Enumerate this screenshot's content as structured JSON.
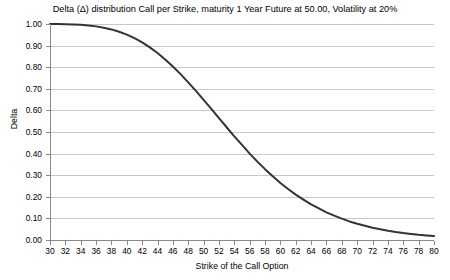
{
  "chart_data": {
    "type": "line",
    "title": "Delta (Δ) distribution Call per Strike, maturity 1 Year Future at 50.00, Volatility at 20%",
    "xlabel": "Strike of the Call Option",
    "ylabel": "Delta",
    "xlim": [
      30,
      80
    ],
    "ylim": [
      0.0,
      1.0
    ],
    "grid": true,
    "legend": null,
    "xticks": [
      30,
      32,
      34,
      36,
      38,
      40,
      42,
      44,
      46,
      48,
      50,
      52,
      54,
      56,
      58,
      60,
      62,
      64,
      66,
      68,
      70,
      72,
      74,
      76,
      78,
      80
    ],
    "xtick_labels": [
      "30",
      "32",
      "34",
      "36",
      "38",
      "40",
      "42",
      "44",
      "46",
      "48",
      "50",
      "52",
      "54",
      "56",
      "58",
      "60",
      "62",
      "64",
      "66",
      "68",
      "70",
      "72",
      "74",
      "76",
      "78",
      "80"
    ],
    "yticks": [
      0.0,
      0.1,
      0.2,
      0.3,
      0.4,
      0.5,
      0.6,
      0.7,
      0.8,
      0.9,
      1.0
    ],
    "ytick_labels": [
      "0.00",
      "0.10",
      "0.20",
      "0.30",
      "0.40",
      "0.50",
      "0.60",
      "0.70",
      "0.80",
      "0.90",
      "1.00"
    ],
    "series": [
      {
        "name": "Delta",
        "color": "#333333",
        "width": 2,
        "x": [
          30,
          31,
          32,
          33,
          34,
          35,
          36,
          37,
          38,
          39,
          40,
          41,
          42,
          43,
          44,
          45,
          46,
          47,
          48,
          49,
          50,
          51,
          52,
          53,
          54,
          55,
          56,
          57,
          58,
          59,
          60,
          61,
          62,
          63,
          64,
          65,
          66,
          67,
          68,
          69,
          70,
          71,
          72,
          73,
          74,
          75,
          76,
          77,
          78,
          79,
          80
        ],
        "values": [
          1.0,
          1.0,
          0.999,
          0.998,
          0.996,
          0.993,
          0.989,
          0.983,
          0.975,
          0.964,
          0.951,
          0.935,
          0.915,
          0.892,
          0.866,
          0.836,
          0.803,
          0.768,
          0.73,
          0.69,
          0.649,
          0.607,
          0.564,
          0.522,
          0.48,
          0.44,
          0.4,
          0.363,
          0.328,
          0.295,
          0.264,
          0.236,
          0.21,
          0.187,
          0.165,
          0.146,
          0.128,
          0.113,
          0.099,
          0.086,
          0.075,
          0.066,
          0.057,
          0.05,
          0.043,
          0.037,
          0.032,
          0.028,
          0.024,
          0.021,
          0.018
        ]
      }
    ]
  },
  "title": {
    "text": "Delta (Δ) distribution Call per Strike, maturity 1 Year Future at 50.00, Volatility at 20%"
  },
  "axes": {
    "y_label": "Delta",
    "x_label": "Strike of the Call Option"
  },
  "colors": {
    "series": "#333333",
    "grid": "#c8c8c8",
    "axis": "#8a8a8a",
    "background": "#ffffff",
    "text": "#000000"
  }
}
